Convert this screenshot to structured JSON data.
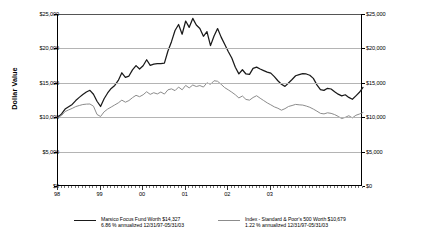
{
  "chart_data": {
    "type": "line",
    "title": "",
    "xlabel": "",
    "ylabel": "Dollar Value",
    "ylim": [
      0,
      25000
    ],
    "grid": true,
    "legend_position": "bottom",
    "y_ticks": [
      "$0",
      "$5,000",
      "$10,000",
      "$15,000",
      "$20,000",
      "$25,000"
    ],
    "y_tick_values": [
      0,
      5000,
      10000,
      15000,
      20000,
      25000
    ],
    "x_ticks": [
      "98",
      "99",
      "00",
      "01",
      "02",
      "03"
    ],
    "x_tick_values": [
      1998,
      1999,
      2000,
      2001,
      2002,
      2003
    ],
    "x_range": [
      "12/31/97",
      "05/31/03"
    ],
    "series": [
      {
        "name": "Marsico Focus Fund",
        "color": "#1a1a1a",
        "values": [
          10000,
          10480,
          11180,
          11520,
          11860,
          12420,
          12880,
          13300,
          13660,
          13910,
          13330,
          12320,
          11560,
          12680,
          13520,
          14180,
          14620,
          15350,
          16460,
          15780,
          15980,
          16880,
          17500,
          17000,
          17480,
          18350,
          17540,
          17700,
          17780,
          17780,
          17860,
          19620,
          20980,
          22600,
          23480,
          22060,
          23980,
          23060,
          24360,
          23400,
          22900,
          21760,
          22450,
          20400,
          21800,
          22880,
          21640,
          20600,
          19550,
          18600,
          17250,
          16300,
          16900,
          16280,
          16220,
          17100,
          17280,
          17000,
          16780,
          16560,
          16400,
          15900,
          15300,
          14800,
          14480,
          14980,
          15480,
          16020,
          16200,
          16320,
          16280,
          16100,
          15640,
          14700,
          14020,
          13900,
          14200,
          14100,
          13700,
          13350,
          13100,
          13260,
          12880,
          12600,
          13100,
          13620,
          14327
        ]
      },
      {
        "name": "Index - Standard & Poor's 500",
        "color": "#8c8c8c",
        "values": [
          10000,
          10240,
          10820,
          11060,
          11280,
          11540,
          11700,
          11840,
          11900,
          11920,
          11600,
          10400,
          10100,
          10780,
          11180,
          11480,
          11780,
          12080,
          12480,
          12180,
          12420,
          12840,
          13180,
          12980,
          13260,
          13700,
          13320,
          13560,
          13380,
          13660,
          13360,
          13980,
          14120,
          13860,
          14380,
          13980,
          14620,
          14260,
          14680,
          14460,
          14600,
          14380,
          15000,
          14780,
          15300,
          15220,
          14780,
          14300,
          13980,
          13640,
          13260,
          12800,
          13080,
          12580,
          12480,
          12860,
          13120,
          12760,
          12420,
          12080,
          11800,
          11500,
          11300,
          11020,
          11240,
          11560,
          11700,
          11860,
          11800,
          11760,
          11620,
          11440,
          11180,
          10880,
          10560,
          10480,
          10640,
          10560,
          10380,
          10120,
          9800,
          9980,
          10220,
          9900,
          10280,
          10460,
          10679
        ]
      }
    ]
  },
  "legend": [
    {
      "color": "#1a1a1a",
      "line1": "Marsico Focus Fund Worth $14,327",
      "line2": "6.86 % annualized 12/31/97-05/31/03"
    },
    {
      "color": "#8c8c8c",
      "line1": "Index - Standard & Poor's 500 Worth $10,679",
      "line2": "1.22 % annualized 12/31/97-05/31/03"
    }
  ],
  "axis": {
    "y_title": "Dollar Value"
  }
}
